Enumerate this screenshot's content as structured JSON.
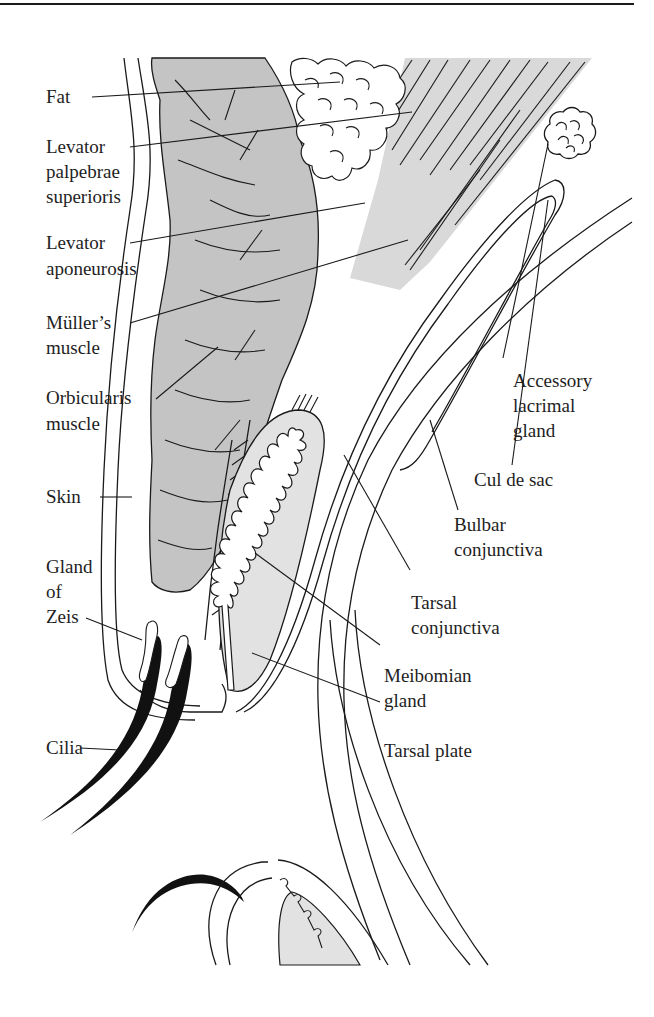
{
  "figure": {
    "colors": {
      "ink": "#1a1a1a",
      "muscle_fill": "#c8c8c8",
      "levator_fill": "#d6d6d6",
      "tarsal_fill": "#e6e6e6",
      "background": "#ffffff"
    },
    "labels_left": [
      {
        "id": "fat",
        "text": "Fat"
      },
      {
        "id": "levator-palpebrae",
        "lines": [
          "Levator",
          "palpebrae",
          "superioris"
        ]
      },
      {
        "id": "levator-aponeurosis",
        "lines": [
          "Levator",
          "aponeurosis"
        ]
      },
      {
        "id": "mullers-muscle",
        "lines": [
          "Müller’s",
          "muscle"
        ]
      },
      {
        "id": "orbicularis-muscle",
        "lines": [
          "Orbicularis",
          "muscle"
        ]
      },
      {
        "id": "skin",
        "text": "Skin"
      },
      {
        "id": "gland-of-zeis",
        "lines": [
          "Gland",
          "of",
          "Zeis"
        ]
      },
      {
        "id": "cilia",
        "text": "Cilia"
      }
    ],
    "labels_right": [
      {
        "id": "accessory-lacrimal-gland",
        "lines": [
          "Accessory",
          "lacrimal",
          "gland"
        ]
      },
      {
        "id": "cul-de-sac",
        "text": "Cul de sac"
      },
      {
        "id": "bulbar-conjunctiva",
        "lines": [
          "Bulbar",
          "conjunctiva"
        ]
      },
      {
        "id": "tarsal-conjunctiva",
        "lines": [
          "Tarsal",
          "conjunctiva"
        ]
      },
      {
        "id": "meibomian-gland",
        "lines": [
          "Meibomian",
          "gland"
        ]
      },
      {
        "id": "tarsal-plate",
        "text": "Tarsal plate"
      }
    ]
  }
}
